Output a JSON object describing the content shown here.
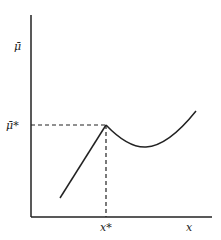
{
  "diagram": {
    "y_axis_label": "μ̄",
    "x_axis_label": "x",
    "peak_y_label": "μ̄*",
    "peak_x_label": "x*",
    "colors": {
      "stroke": "#222222",
      "background": "#ffffff"
    }
  }
}
